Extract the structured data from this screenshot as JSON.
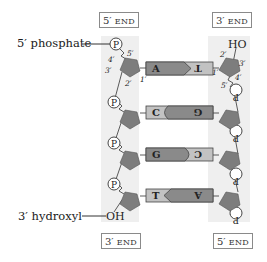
{
  "labels": {
    "top_left_end": {
      "num": "5′",
      "word": "END"
    },
    "top_right_end": {
      "num": "3′",
      "word": "END"
    },
    "bottom_left_end": {
      "num": "3′",
      "word": "END"
    },
    "bottom_right_end": {
      "num": "5′",
      "word": "END"
    },
    "phosphate_label": "5′ phosphate",
    "hydroxyl_label": "3′ hydroxyl",
    "left_oh": "OH",
    "right_ho": "HO"
  },
  "carbon_numbers": {
    "left": [
      "5′",
      "4′",
      "3′",
      "2′",
      "1′"
    ],
    "right": [
      "2′",
      "3′",
      "1′",
      "4′",
      "5′"
    ]
  },
  "phosphate_symbol": "P",
  "base_pairs": [
    {
      "left": "A",
      "right": "T",
      "left_shape": "arrow",
      "pair_type": "A-T"
    },
    {
      "left": "C",
      "right": "G",
      "left_shape": "cup",
      "pair_type": "C-G"
    },
    {
      "left": "G",
      "right": "C",
      "left_shape": "bullet",
      "pair_type": "G-C"
    },
    {
      "left": "T",
      "right": "A",
      "left_shape": "notch",
      "pair_type": "T-A"
    }
  ],
  "colors": {
    "sugar": "#7d7d7d",
    "purine": "#8a8a8a",
    "pyrimidine": "#c2c2c2",
    "backbone_bg": "#efefef",
    "line": "#333333"
  }
}
